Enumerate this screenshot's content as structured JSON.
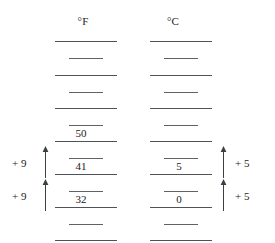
{
  "figure": {
    "type": "temperature-scale-comparison",
    "background": "#ffffff",
    "line_color": "#555a5e",
    "text_color": "#1a1a1a"
  },
  "columns": [
    {
      "id": "fahrenheit",
      "header": "°F",
      "header_x": 83,
      "header_y": 16,
      "major_x": 55,
      "major_width": 62,
      "minor_x": 69,
      "minor_width": 34,
      "labels": [
        {
          "text": "50",
          "x": 71,
          "y": 128
        },
        {
          "text": "41",
          "x": 71,
          "y": 161
        },
        {
          "text": "32",
          "x": 71,
          "y": 194
        }
      ]
    },
    {
      "id": "celsius",
      "header": "°C",
      "header_x": 173,
      "header_y": 16,
      "major_x": 150,
      "major_width": 62,
      "minor_x": 164,
      "minor_width": 34,
      "labels": [
        {
          "text": "5",
          "x": 169,
          "y": 161
        },
        {
          "text": "0",
          "x": 169,
          "y": 194
        }
      ]
    }
  ],
  "ticks": {
    "major_y": [
      41,
      75,
      108,
      141,
      174,
      207,
      240
    ],
    "minor_y": [
      58,
      92,
      125,
      158,
      191,
      224
    ]
  },
  "annotations": {
    "left": [
      {
        "text": "+ 9",
        "label_x": 12,
        "label_y": 158,
        "arrow_x": 41,
        "arrow_top": 146,
        "arrow_height": 32
      },
      {
        "text": "+ 9",
        "label_x": 12,
        "label_y": 191,
        "arrow_x": 41,
        "arrow_top": 179,
        "arrow_height": 32
      }
    ],
    "right": [
      {
        "text": "+ 5",
        "label_x": 235,
        "label_y": 158,
        "arrow_x": 219,
        "arrow_top": 146,
        "arrow_height": 32
      },
      {
        "text": "+ 5",
        "label_x": 235,
        "label_y": 191,
        "arrow_x": 219,
        "arrow_top": 179,
        "arrow_height": 32
      }
    ]
  }
}
